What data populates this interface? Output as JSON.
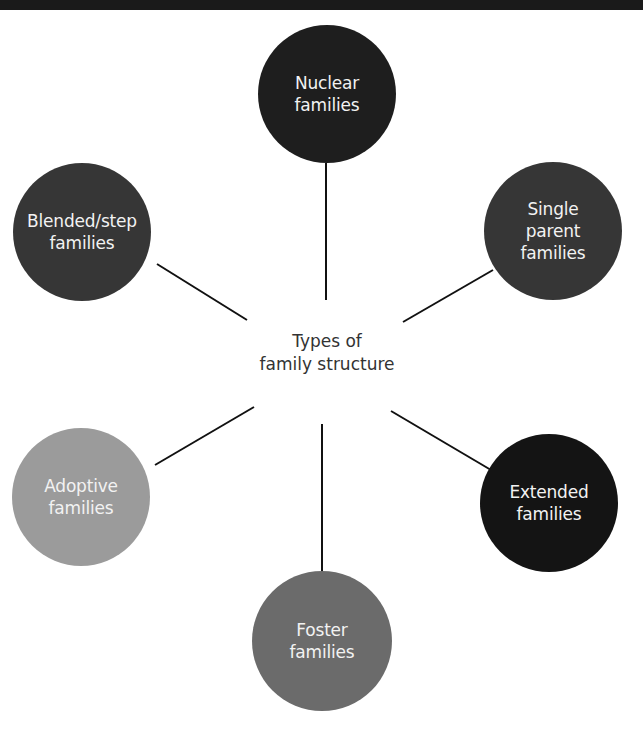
{
  "diagram": {
    "type": "hub-and-spoke",
    "center": {
      "label": "Types of\nfamily structure"
    },
    "nodes": [
      {
        "id": "nuclear",
        "label": "Nuclear\nfamilies",
        "color": "#1e1e1e",
        "cx": 327,
        "cy": 94,
        "r": 69
      },
      {
        "id": "single-parent",
        "label": "Single\nparent\nfamilies",
        "color": "#363636",
        "cx": 553,
        "cy": 231,
        "r": 69
      },
      {
        "id": "extended",
        "label": "Extended\nfamilies",
        "color": "#141414",
        "cx": 549,
        "cy": 503,
        "r": 69
      },
      {
        "id": "foster",
        "label": "Foster\nfamilies",
        "color": "#6b6b6b",
        "cx": 322,
        "cy": 641,
        "r": 70
      },
      {
        "id": "adoptive",
        "label": "Adoptive\nfamilies",
        "color": "#9b9b9b",
        "cx": 81,
        "cy": 497,
        "r": 69
      },
      {
        "id": "blended-step",
        "label": "Blended/step\nfamilies",
        "color": "#363636",
        "cx": 82,
        "cy": 232,
        "r": 69
      }
    ],
    "edges": [
      {
        "to": "nuclear",
        "x1": 326,
        "y1": 300,
        "x2": 326,
        "y2": 163
      },
      {
        "to": "single-parent",
        "x1": 403,
        "y1": 322,
        "x2": 493,
        "y2": 270
      },
      {
        "to": "extended",
        "x1": 391,
        "y1": 411,
        "x2": 491,
        "y2": 470
      },
      {
        "to": "foster",
        "x1": 322,
        "y1": 424,
        "x2": 322,
        "y2": 571
      },
      {
        "to": "adoptive",
        "x1": 254,
        "y1": 407,
        "x2": 155,
        "y2": 465
      },
      {
        "to": "blended-step",
        "x1": 247,
        "y1": 320,
        "x2": 157,
        "y2": 264
      }
    ],
    "edge_color": "#111111"
  }
}
